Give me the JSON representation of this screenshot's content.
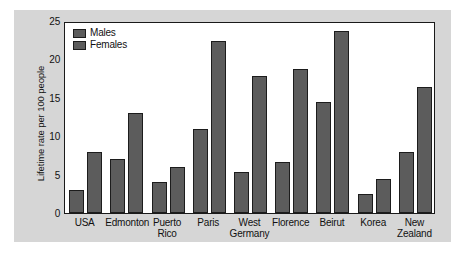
{
  "chart_data": {
    "type": "bar",
    "title": "",
    "xlabel": "",
    "ylabel": "Lifetime rate per 100 people",
    "ylim": [
      0,
      25
    ],
    "yticks": [
      0,
      5,
      10,
      15,
      20,
      25
    ],
    "grid": false,
    "legend_position": "top-left inside plot",
    "categories": [
      "USA",
      "Edmonton",
      "Puerto\nRico",
      "Paris",
      "West\nGermany",
      "Florence",
      "Beirut",
      "Korea",
      "New\nZealand"
    ],
    "series": [
      {
        "name": "Males",
        "values": [
          3.0,
          7.0,
          4.0,
          11.0,
          5.3,
          6.6,
          14.5,
          2.5,
          7.9
        ]
      },
      {
        "name": "Females",
        "values": [
          7.9,
          13.0,
          6.0,
          22.4,
          17.8,
          18.8,
          23.7,
          4.4,
          16.4
        ]
      }
    ]
  },
  "colors": {
    "bar_fill": "#5c5c5c",
    "bar_outline": "#1c1c1c",
    "plot_background": "#ffffff",
    "figure_background": "#d6d6d6",
    "axis": "#1a1a1a",
    "text": "#111111"
  }
}
